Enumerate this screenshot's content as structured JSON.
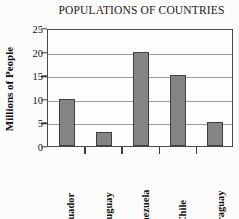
{
  "chart_data": {
    "type": "bar",
    "title": "POPULATIONS OF COUNTRIES",
    "xlabel": "",
    "ylabel": "Millions of People",
    "categories": [
      "Ecuador",
      "Uruguay",
      "Venezuela",
      "Chile",
      "Paraguay"
    ],
    "values": [
      10,
      3,
      20,
      15,
      5
    ],
    "ylim": [
      0,
      25
    ],
    "ytick_labels": [
      "0",
      "5",
      "10",
      "15",
      "20",
      "25"
    ],
    "ytick_values": [
      0,
      5,
      10,
      15,
      20,
      25
    ],
    "grid": true,
    "legend": false,
    "colors": {
      "bar_fill": "#858585",
      "bar_edge": "#3f3f3f",
      "gridline": "#9a9a9a",
      "axis": "#4a4a4a",
      "text": "#111111",
      "background": "#fdfdfc"
    }
  }
}
